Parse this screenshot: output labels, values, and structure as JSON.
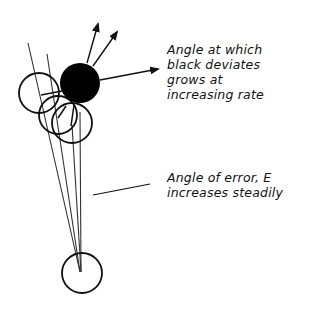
{
  "diagram": {
    "colors": {
      "ink": "#111111",
      "background": "#ffffff",
      "black_ball": "#000000"
    },
    "annotations": [
      {
        "id": "deviation",
        "lines": [
          "Angle at which",
          "black deviates",
          "grows at",
          "increasing rate"
        ]
      },
      {
        "id": "error",
        "lines": [
          "Angle of error, E",
          "increases steadily"
        ]
      }
    ],
    "elements": {
      "cue_ball": "white ball at bottom (origin)",
      "object_ball": "black ball, filled",
      "ghost_balls": 3,
      "aim_lines": 4,
      "deviation_arrows": 3
    }
  }
}
